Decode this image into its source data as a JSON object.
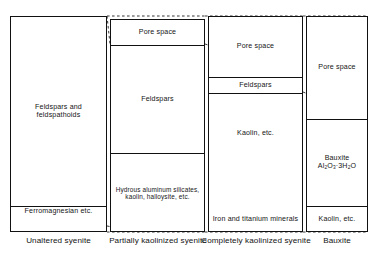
{
  "diagram": {
    "type": "stacked-column-comparison",
    "stroke_color": "#111111",
    "background_color": "#ffffff",
    "columns": [
      {
        "id": "unaltered-syenite",
        "caption": "Unaltered syenite",
        "bands": [
          {
            "id": "feldspars-feldspathoids",
            "label": "Feldspars and feldspathoids"
          },
          {
            "id": "ferromagnesian",
            "label": "Ferromagnesian etc."
          }
        ]
      },
      {
        "id": "partially-kaolinized-syenite",
        "caption": "Partially kaolinized syenite",
        "bands": [
          {
            "id": "pore-space",
            "label": "Pore space"
          },
          {
            "id": "feldspars",
            "label": "Feldspars"
          },
          {
            "id": "hydrous-aluminum-silicates",
            "label": "Hydrous aluminum silicates, kaolin, halloysite, etc."
          }
        ]
      },
      {
        "id": "completely-kaolinized-syenite",
        "caption": "Completely kaolinized syenite",
        "bands": [
          {
            "id": "pore-space",
            "label": "Pore space"
          },
          {
            "id": "feldspars",
            "label": "Feldspars"
          },
          {
            "id": "kaolin",
            "label": "Kaolin, etc."
          },
          {
            "id": "iron-titanium-minerals",
            "label": "Iron and titanium minerals"
          }
        ]
      },
      {
        "id": "bauxite",
        "caption": "Bauxite",
        "bands": [
          {
            "id": "pore-space",
            "label": "Pore space"
          },
          {
            "id": "bauxite",
            "label": "Bauxite",
            "formula_main": "Al",
            "formula_sub1": "2",
            "formula_mid": "O",
            "formula_sub2": "3",
            "formula_dot": "·3H",
            "formula_sub3": "2",
            "formula_end": "O"
          },
          {
            "id": "kaolin",
            "label": "Kaolin, etc."
          }
        ]
      }
    ]
  }
}
